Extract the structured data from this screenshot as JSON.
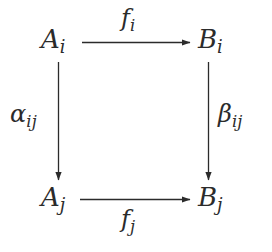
{
  "diagram": {
    "type": "commutative-square",
    "background_color": "#ffffff",
    "ink_color": "#2b2b2b",
    "nodes": [
      {
        "id": "a-i",
        "base": "A",
        "subscript": "i",
        "position": "top-left"
      },
      {
        "id": "b-i",
        "base": "B",
        "subscript": "i",
        "position": "top-right"
      },
      {
        "id": "a-j",
        "base": "A",
        "subscript": "j",
        "position": "bottom-left"
      },
      {
        "id": "b-j",
        "base": "B",
        "subscript": "j",
        "position": "bottom-right"
      }
    ],
    "edges": [
      {
        "id": "f-i",
        "base": "f",
        "subscript": "i",
        "from": "a-i",
        "to": "b-i",
        "direction": "right",
        "label_position": "above"
      },
      {
        "id": "f-j",
        "base": "f",
        "subscript": "j",
        "from": "a-j",
        "to": "b-j",
        "direction": "right",
        "label_position": "below"
      },
      {
        "id": "alpha-ij",
        "base": "α",
        "subscript": "ij",
        "from": "a-i",
        "to": "a-j",
        "direction": "down",
        "label_position": "left"
      },
      {
        "id": "beta-ij",
        "base": "β",
        "subscript": "ij",
        "from": "b-i",
        "to": "b-j",
        "direction": "down",
        "label_position": "right"
      }
    ]
  }
}
